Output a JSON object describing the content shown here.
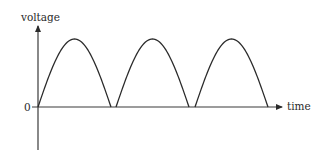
{
  "diagram": {
    "y_axis_label": "voltage",
    "x_axis_label": "time",
    "origin_label": "0",
    "waveform": "rectified sine",
    "hump_count": 3,
    "line_color": "#2b2b2b"
  }
}
